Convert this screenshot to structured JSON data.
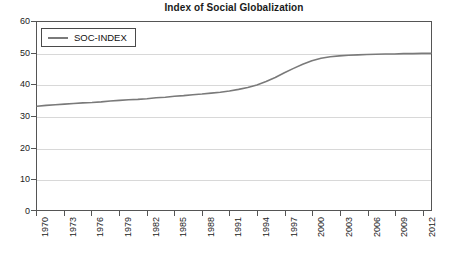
{
  "chart_data": {
    "type": "line",
    "title": "Index of Social Globalization",
    "xlabel": "",
    "ylabel": "",
    "grid": true,
    "legend_position": "top-left",
    "xlim": [
      1970,
      2013
    ],
    "ylim": [
      0,
      60
    ],
    "yticks": [
      0,
      10,
      20,
      30,
      40,
      50,
      60
    ],
    "xticks": [
      1970,
      1973,
      1976,
      1979,
      1982,
      1985,
      1988,
      1991,
      1994,
      1997,
      2000,
      2003,
      2006,
      2009,
      2012
    ],
    "series": [
      {
        "name": "SOC-INDEX",
        "color": "#7a7a7a",
        "x": [
          1970,
          1971,
          1972,
          1973,
          1974,
          1975,
          1976,
          1977,
          1978,
          1979,
          1980,
          1981,
          1982,
          1983,
          1984,
          1985,
          1986,
          1987,
          1988,
          1989,
          1990,
          1991,
          1992,
          1993,
          1994,
          1995,
          1996,
          1997,
          1998,
          1999,
          2000,
          2001,
          2002,
          2003,
          2004,
          2005,
          2006,
          2007,
          2008,
          2009,
          2010,
          2011,
          2012,
          2013
        ],
        "values": [
          33.1,
          33.4,
          33.6,
          33.8,
          34.0,
          34.2,
          34.3,
          34.5,
          34.8,
          35.0,
          35.2,
          35.3,
          35.5,
          35.8,
          36.0,
          36.3,
          36.5,
          36.8,
          37.0,
          37.3,
          37.6,
          38.0,
          38.5,
          39.1,
          39.9,
          41.0,
          42.3,
          43.8,
          45.2,
          46.5,
          47.6,
          48.4,
          48.9,
          49.2,
          49.4,
          49.5,
          49.6,
          49.7,
          49.8,
          49.8,
          49.9,
          49.9,
          50.0,
          50.0
        ]
      }
    ]
  },
  "legend": {
    "entries": [
      {
        "label": "SOC-INDEX"
      }
    ]
  }
}
